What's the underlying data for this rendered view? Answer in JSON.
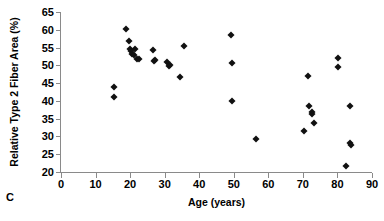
{
  "panel": {
    "letter": "C"
  },
  "chart_data": {
    "type": "scatter",
    "title": "",
    "xlabel": "Age (years)",
    "ylabel": "Relative Type 2 Fiber Area (%)",
    "xlim": [
      0,
      90
    ],
    "ylim": [
      20,
      65
    ],
    "xticks": [
      0,
      10,
      20,
      30,
      40,
      50,
      60,
      70,
      80,
      90
    ],
    "yticks": [
      20,
      25,
      30,
      35,
      40,
      45,
      50,
      55,
      60,
      65
    ],
    "xtick_labels": [
      "0",
      "10",
      "20",
      "30",
      "40",
      "50",
      "60",
      "70",
      "80",
      "90"
    ],
    "ytick_labels": [
      "20",
      "25",
      "30",
      "35",
      "40",
      "45",
      "50",
      "55",
      "60",
      "65"
    ],
    "grid": false,
    "legend": false,
    "marker": {
      "shape": "diamond",
      "color": "#111111",
      "size": 5
    },
    "series": [
      {
        "name": "Subjects",
        "points": [
          [
            15.2,
            44.0
          ],
          [
            15.3,
            41.0
          ],
          [
            18.7,
            60.2
          ],
          [
            19.6,
            56.8
          ],
          [
            19.9,
            54.6
          ],
          [
            20.3,
            53.9
          ],
          [
            20.6,
            53.3
          ],
          [
            21.0,
            52.9
          ],
          [
            21.4,
            54.6
          ],
          [
            22.0,
            51.9
          ],
          [
            22.7,
            51.9
          ],
          [
            26.7,
            54.3
          ],
          [
            26.8,
            51.2
          ],
          [
            27.3,
            51.4
          ],
          [
            30.7,
            50.8
          ],
          [
            31.2,
            49.9
          ],
          [
            31.5,
            50.1
          ],
          [
            34.3,
            46.8
          ],
          [
            35.5,
            55.4
          ],
          [
            49.3,
            58.6
          ],
          [
            49.4,
            50.6
          ],
          [
            49.5,
            39.9
          ],
          [
            56.4,
            29.3
          ],
          [
            70.2,
            31.6
          ],
          [
            71.6,
            47.1
          ],
          [
            71.8,
            38.7
          ],
          [
            72.5,
            36.8
          ],
          [
            72.7,
            36.4
          ],
          [
            73.2,
            33.7
          ],
          [
            80.1,
            52.1
          ],
          [
            80.2,
            49.4
          ],
          [
            82.6,
            21.6
          ],
          [
            83.6,
            38.6
          ],
          [
            83.7,
            28.1
          ],
          [
            83.9,
            27.5
          ]
        ]
      }
    ]
  }
}
